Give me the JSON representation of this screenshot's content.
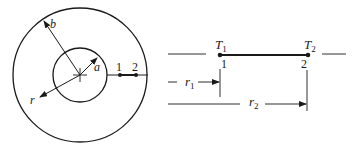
{
  "diagram": {
    "type": "annular-cylinder-cross-section",
    "colors": {
      "stroke": "#1a1a1a",
      "background": "#ffffff"
    },
    "left": {
      "outer_radius_label": "b",
      "inner_radius_label": "a",
      "radial_coordinate_label": "r",
      "point_1_label": "1",
      "point_2_label": "2"
    },
    "right": {
      "T1_label": "T",
      "T1_sub": "1",
      "T2_label": "T",
      "T2_sub": "2",
      "node_1_label": "1",
      "node_2_label": "2",
      "r1_label": "r",
      "r1_sub": "1",
      "r2_label": "r",
      "r2_sub": "2"
    }
  }
}
